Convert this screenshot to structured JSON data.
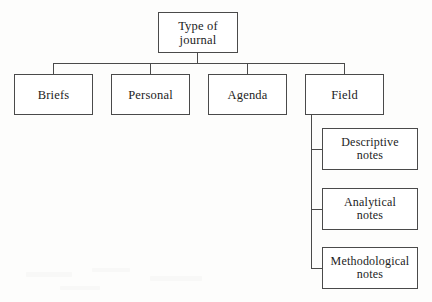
{
  "diagram": {
    "type": "tree",
    "line_color": "#4a4a4a",
    "text_color": "#1c1c1c",
    "background_color": "#fdfdfc",
    "node_fill": "#ffffff",
    "root": {
      "label": "Type of\njournal",
      "line1": "Type of",
      "line2": "journal"
    },
    "level2": [
      {
        "label": "Briefs"
      },
      {
        "label": "Personal"
      },
      {
        "label": "Agenda"
      },
      {
        "label": "Field"
      }
    ],
    "level3": [
      {
        "line1": "Descriptive",
        "line2": "notes"
      },
      {
        "line1": "Analytical",
        "line2": "notes"
      },
      {
        "line1": "Methodological",
        "line2": "notes"
      }
    ]
  }
}
